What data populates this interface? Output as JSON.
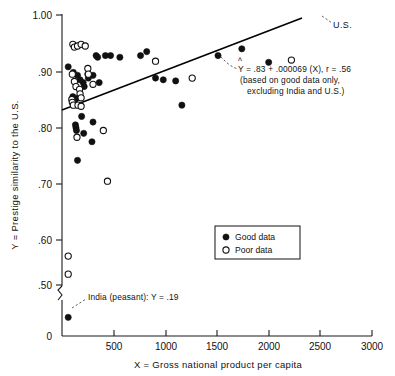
{
  "chart_data": {
    "type": "scatter",
    "title": "",
    "xlabel": "X = Gross national product per capita",
    "ylabel": "Y = Prestige similarity to the U.S.",
    "xlim": [
      0,
      3000
    ],
    "ylim": [
      0.45,
      1.0
    ],
    "y_axis_break": true,
    "y_break_label": "0",
    "grid": false,
    "xticks": [
      0,
      500,
      1000,
      1500,
      2000,
      2500,
      3000
    ],
    "xtick_labels": [
      "0",
      "500",
      "1000",
      "1500",
      "2000",
      "2500",
      "3000"
    ],
    "yticks": [
      0.5,
      0.6,
      0.7,
      0.8,
      0.9,
      1.0
    ],
    "ytick_labels": [
      ".50",
      ".60",
      ".70",
      ".80",
      ".90",
      "1.00"
    ],
    "legend_position": "lower-right",
    "series": [
      {
        "name": "Good data",
        "marker": "filled-circle",
        "color": "#111111",
        "points": [
          [
            60,
            0.908
          ],
          [
            110,
            0.898
          ],
          [
            150,
            0.893
          ],
          [
            175,
            0.885
          ],
          [
            205,
            0.88
          ],
          [
            215,
            0.873
          ],
          [
            250,
            0.895
          ],
          [
            255,
            0.888
          ],
          [
            300,
            0.893
          ],
          [
            330,
            0.928
          ],
          [
            345,
            0.925
          ],
          [
            360,
            0.88
          ],
          [
            420,
            0.928
          ],
          [
            470,
            0.928
          ],
          [
            560,
            0.925
          ],
          [
            760,
            0.928
          ],
          [
            820,
            0.935
          ],
          [
            905,
            0.888
          ],
          [
            980,
            0.885
          ],
          [
            1100,
            0.883
          ],
          [
            1160,
            0.84
          ],
          [
            1510,
            0.928
          ],
          [
            1740,
            0.94
          ],
          [
            2000,
            0.916
          ],
          [
            105,
            0.855
          ],
          [
            140,
            0.852
          ],
          [
            120,
            0.845
          ],
          [
            130,
            0.805
          ],
          [
            135,
            0.8
          ],
          [
            140,
            0.795
          ],
          [
            190,
            0.82
          ],
          [
            210,
            0.79
          ],
          [
            300,
            0.81
          ],
          [
            290,
            0.775
          ],
          [
            150,
            0.742
          ],
          [
            60,
            0.19
          ]
        ]
      },
      {
        "name": "Poor data",
        "marker": "open-circle",
        "color": "#ffffff",
        "points": [
          [
            105,
            0.948
          ],
          [
            120,
            0.943
          ],
          [
            150,
            0.945
          ],
          [
            185,
            0.948
          ],
          [
            225,
            0.945
          ],
          [
            100,
            0.895
          ],
          [
            120,
            0.882
          ],
          [
            135,
            0.873
          ],
          [
            170,
            0.868
          ],
          [
            250,
            0.905
          ],
          [
            255,
            0.895
          ],
          [
            300,
            0.877
          ],
          [
            175,
            0.86
          ],
          [
            185,
            0.853
          ],
          [
            95,
            0.85
          ],
          [
            100,
            0.845
          ],
          [
            110,
            0.84
          ],
          [
            155,
            0.84
          ],
          [
            185,
            0.838
          ],
          [
            145,
            0.783
          ],
          [
            400,
            0.795
          ],
          [
            440,
            0.705
          ],
          [
            905,
            0.918
          ],
          [
            1260,
            0.888
          ],
          [
            2220,
            0.92
          ],
          [
            60,
            0.572
          ],
          [
            60,
            0.54
          ]
        ]
      }
    ],
    "regression": {
      "equation_line1": "Y = .83 + .000069 (X), r = .56",
      "equation_hat": "^",
      "equation_line2": "(based on good data only,",
      "equation_line3": "excluding India and U.S.)",
      "intercept": 0.83,
      "slope": 6.9e-05,
      "r": 0.56,
      "x_start": 0,
      "x_end": 2310
    },
    "annotations": [
      {
        "name": "us-point-label",
        "text": "U.S.",
        "x": 2450,
        "y": 1.002
      },
      {
        "name": "india-point-label",
        "text": "India (peasant): Y = .19",
        "x": 60,
        "y": 0.19
      }
    ]
  },
  "legend": {
    "items": [
      {
        "label": "Good data",
        "marker": "filled-circle"
      },
      {
        "label": "Poor data",
        "marker": "open-circle"
      }
    ]
  }
}
